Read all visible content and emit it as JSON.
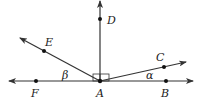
{
  "diagram": {
    "title": "",
    "colors": {
      "stroke": "#333333",
      "point": "#111111",
      "text": "#222222",
      "background": "#ffffff"
    },
    "points": [
      {
        "id": "A",
        "label": "A",
        "x": 100,
        "y": 81
      },
      {
        "id": "B",
        "label": "B",
        "x": 166,
        "y": 81
      },
      {
        "id": "C",
        "label": "C",
        "x": 164,
        "y": 67
      },
      {
        "id": "D",
        "label": "D",
        "x": 100,
        "y": 19
      },
      {
        "id": "E",
        "label": "E",
        "x": 44,
        "y": 51
      },
      {
        "id": "F",
        "label": "F",
        "x": 36,
        "y": 81
      }
    ],
    "lines": [
      {
        "id": "line-FB",
        "description": "horizontal line through F, A, B (arrows both ends)"
      },
      {
        "id": "ray-AD",
        "description": "vertical ray from A through D"
      },
      {
        "id": "ray-AE",
        "description": "ray from A through E"
      },
      {
        "id": "ray-AC",
        "description": "ray from A through C"
      }
    ],
    "angles": [
      {
        "id": "alpha",
        "symbol": "α",
        "between": [
          "AB",
          "AC"
        ]
      },
      {
        "id": "beta",
        "symbol": "β",
        "between": [
          "AF",
          "AE"
        ]
      },
      {
        "id": "right-angle",
        "symbol": "right-angle-mark",
        "between": [
          "AD",
          "AB/AF"
        ]
      }
    ],
    "labels": {
      "A": "A",
      "B": "B",
      "C": "C",
      "D": "D",
      "E": "E",
      "F": "F",
      "alpha": "α",
      "beta": "β"
    }
  }
}
